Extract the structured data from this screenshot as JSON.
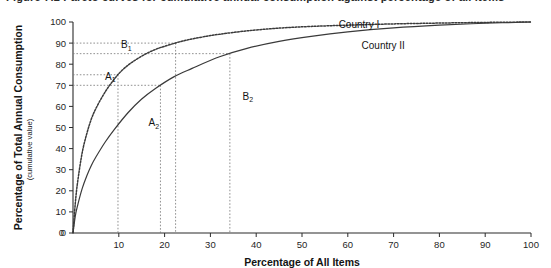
{
  "figure": {
    "top_caption_partial": "Figure 7.2  Pareto curves for cumulative annual consumption against percentage of all items"
  },
  "chart_data": {
    "type": "line",
    "title": "",
    "xlabel": "Percentage of All Items",
    "ylabel": "Percentage of Total Annual Consumption",
    "ylabel_sub": "(cumulative value)",
    "xlim": [
      0,
      100
    ],
    "ylim": [
      0,
      100
    ],
    "xticks": [
      0,
      10,
      20,
      30,
      40,
      50,
      60,
      70,
      80,
      90,
      100
    ],
    "xtick_labels": [
      "0",
      "10",
      "20",
      "30",
      "40",
      "50",
      "60",
      "70",
      "80",
      "90",
      "100"
    ],
    "yticks": [
      0,
      10,
      20,
      30,
      40,
      50,
      60,
      70,
      80,
      90,
      100
    ],
    "ytick_labels": [
      "0",
      "10",
      "20",
      "30",
      "40",
      "50",
      "60",
      "70",
      "80",
      "90",
      "100"
    ],
    "grid": false,
    "legend_position": "inline-annotation",
    "series": [
      {
        "name": "Country I",
        "style": "dotted",
        "label": "Country I",
        "label_x": 58,
        "label_y": 97,
        "x": [
          0,
          0.5,
          1,
          2,
          3,
          4,
          5,
          6.5,
          8,
          10,
          12,
          14,
          16,
          18,
          20,
          24,
          28,
          32,
          38,
          45,
          52,
          60,
          70,
          80,
          90,
          100
        ],
        "y": [
          0,
          14,
          24,
          38,
          47,
          54,
          59,
          65,
          70,
          75.5,
          79.5,
          82.5,
          85,
          87,
          88.5,
          91,
          92.8,
          94.2,
          95.8,
          97.1,
          97.9,
          98.5,
          99.1,
          99.5,
          99.8,
          100
        ]
      },
      {
        "name": "Country II",
        "style": "solid",
        "label": "Country II",
        "label_x": 63,
        "label_y": 87,
        "x": [
          0,
          0.5,
          1,
          2,
          3,
          4,
          5,
          7,
          9,
          12,
          15,
          18,
          22,
          26,
          32,
          38,
          45,
          52,
          60,
          70,
          80,
          90,
          100
        ],
        "y": [
          0,
          8,
          13,
          21,
          27,
          32,
          36,
          43,
          49,
          57,
          63.5,
          68.5,
          74,
          78,
          83.5,
          87.5,
          90.8,
          93.2,
          95.3,
          97.2,
          98.5,
          99.4,
          100
        ]
      }
    ],
    "annotations": [
      {
        "id": "B1",
        "base": "B",
        "sub": "1",
        "x": 10.5,
        "y": 87.5
      },
      {
        "id": "A1",
        "base": "A",
        "sub": "1",
        "x": 7.0,
        "y": 72.5
      },
      {
        "id": "A2",
        "base": "A",
        "sub": "2",
        "x": 16.5,
        "y": 50.5
      },
      {
        "id": "B2",
        "base": "B",
        "sub": "2",
        "x": 37.0,
        "y": 63.0
      }
    ],
    "guides": {
      "horizontal_values": [
        90,
        85,
        75,
        70
      ],
      "vertical_values": [
        6.5,
        13,
        15.5,
        30.5
      ]
    }
  }
}
